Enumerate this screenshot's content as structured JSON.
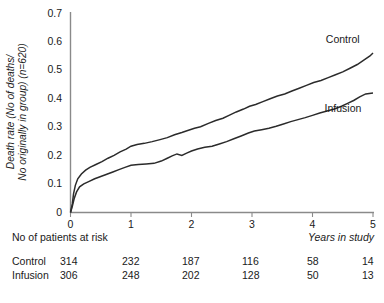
{
  "chart_data": {
    "type": "line",
    "title": "",
    "xlabel": "Years in study",
    "ylabel": "Death rate (No of deaths/ No originally in group) (n=620)",
    "ylabel_line1": "Death rate (No of deaths/",
    "ylabel_line2": "No originally in group) (n=620)",
    "xlim": [
      0,
      5
    ],
    "ylim": [
      0,
      0.7
    ],
    "xticks": [
      0,
      1,
      2,
      3,
      4,
      5
    ],
    "xtick_labels": [
      "0",
      "1",
      "2",
      "3",
      "4",
      "5"
    ],
    "yticks": [
      0,
      0.1,
      0.2,
      0.3,
      0.4,
      0.5,
      0.6,
      0.7
    ],
    "ytick_labels": [
      "0",
      "0.1",
      "0.2",
      "0.3",
      "0.4",
      "0.5",
      "0.6",
      "0.7"
    ],
    "grid": false,
    "legend_position": "inline-right",
    "series": [
      {
        "name": "Control",
        "label": "Control",
        "color": "#2b2b2b",
        "points": [
          [
            0.0,
            0.0
          ],
          [
            0.03,
            0.03
          ],
          [
            0.05,
            0.065
          ],
          [
            0.08,
            0.095
          ],
          [
            0.12,
            0.118
          ],
          [
            0.18,
            0.135
          ],
          [
            0.25,
            0.148
          ],
          [
            0.32,
            0.158
          ],
          [
            0.42,
            0.168
          ],
          [
            0.52,
            0.178
          ],
          [
            0.62,
            0.19
          ],
          [
            0.72,
            0.2
          ],
          [
            0.82,
            0.212
          ],
          [
            0.92,
            0.222
          ],
          [
            1.0,
            0.232
          ],
          [
            1.1,
            0.238
          ],
          [
            1.22,
            0.242
          ],
          [
            1.35,
            0.248
          ],
          [
            1.48,
            0.255
          ],
          [
            1.6,
            0.262
          ],
          [
            1.72,
            0.272
          ],
          [
            1.84,
            0.28
          ],
          [
            1.95,
            0.288
          ],
          [
            2.05,
            0.295
          ],
          [
            2.15,
            0.3
          ],
          [
            2.28,
            0.312
          ],
          [
            2.4,
            0.322
          ],
          [
            2.52,
            0.33
          ],
          [
            2.62,
            0.34
          ],
          [
            2.74,
            0.352
          ],
          [
            2.86,
            0.362
          ],
          [
            2.96,
            0.372
          ],
          [
            3.06,
            0.378
          ],
          [
            3.18,
            0.388
          ],
          [
            3.3,
            0.398
          ],
          [
            3.42,
            0.408
          ],
          [
            3.54,
            0.415
          ],
          [
            3.66,
            0.425
          ],
          [
            3.78,
            0.435
          ],
          [
            3.9,
            0.445
          ],
          [
            4.02,
            0.455
          ],
          [
            4.14,
            0.462
          ],
          [
            4.26,
            0.472
          ],
          [
            4.38,
            0.482
          ],
          [
            4.5,
            0.492
          ],
          [
            4.62,
            0.505
          ],
          [
            4.74,
            0.518
          ],
          [
            4.86,
            0.535
          ],
          [
            4.95,
            0.548
          ],
          [
            5.0,
            0.558
          ]
        ]
      },
      {
        "name": "Infusion",
        "label": "Infusion",
        "color": "#2b2b2b",
        "points": [
          [
            0.0,
            0.0
          ],
          [
            0.03,
            0.022
          ],
          [
            0.06,
            0.048
          ],
          [
            0.1,
            0.072
          ],
          [
            0.15,
            0.09
          ],
          [
            0.22,
            0.1
          ],
          [
            0.3,
            0.108
          ],
          [
            0.4,
            0.118
          ],
          [
            0.5,
            0.126
          ],
          [
            0.6,
            0.134
          ],
          [
            0.7,
            0.142
          ],
          [
            0.8,
            0.15
          ],
          [
            0.9,
            0.158
          ],
          [
            1.0,
            0.165
          ],
          [
            1.12,
            0.168
          ],
          [
            1.25,
            0.17
          ],
          [
            1.38,
            0.172
          ],
          [
            1.5,
            0.18
          ],
          [
            1.6,
            0.19
          ],
          [
            1.68,
            0.198
          ],
          [
            1.76,
            0.205
          ],
          [
            1.84,
            0.2
          ],
          [
            1.92,
            0.208
          ],
          [
            2.0,
            0.215
          ],
          [
            2.1,
            0.222
          ],
          [
            2.22,
            0.228
          ],
          [
            2.34,
            0.232
          ],
          [
            2.46,
            0.24
          ],
          [
            2.58,
            0.248
          ],
          [
            2.7,
            0.258
          ],
          [
            2.82,
            0.268
          ],
          [
            2.94,
            0.278
          ],
          [
            3.04,
            0.285
          ],
          [
            3.16,
            0.29
          ],
          [
            3.28,
            0.295
          ],
          [
            3.4,
            0.302
          ],
          [
            3.52,
            0.31
          ],
          [
            3.64,
            0.318
          ],
          [
            3.76,
            0.325
          ],
          [
            3.88,
            0.332
          ],
          [
            4.0,
            0.34
          ],
          [
            4.12,
            0.348
          ],
          [
            4.24,
            0.355
          ],
          [
            4.36,
            0.362
          ],
          [
            4.48,
            0.372
          ],
          [
            4.58,
            0.382
          ],
          [
            4.68,
            0.392
          ],
          [
            4.78,
            0.405
          ],
          [
            4.88,
            0.415
          ],
          [
            5.0,
            0.418
          ]
        ]
      }
    ],
    "annotations": [
      {
        "text": "Control",
        "x": 4.22,
        "y": 0.595
      },
      {
        "text": "Infusion",
        "x": 4.2,
        "y": 0.352
      }
    ]
  },
  "risk_table": {
    "title": "No of patients at risk",
    "columns": [
      "0",
      "1",
      "2",
      "3",
      "4",
      "5"
    ],
    "rows": [
      {
        "label": "Control",
        "values": [
          "314",
          "232",
          "187",
          "116",
          "58",
          "14"
        ]
      },
      {
        "label": "Infusion",
        "values": [
          "306",
          "248",
          "202",
          "128",
          "50",
          "13"
        ]
      }
    ]
  }
}
